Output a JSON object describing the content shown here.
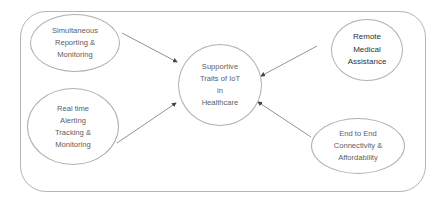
{
  "diagram": {
    "center": {
      "label": "Supportive\nTraits of IoT\nin\nHealthcare"
    },
    "nodes": [
      {
        "id": "simultaneous",
        "label": "Simultaneous\nReporting &\nMonitoring"
      },
      {
        "id": "realtime",
        "label": "Real time\nAlerting\nTracking &\nMonitoring"
      },
      {
        "id": "remote",
        "label": "Remote\nMedical\nAssistance"
      },
      {
        "id": "endtoend",
        "label": "End to End\nConnectivity &\nAffordability"
      }
    ],
    "edges": [
      {
        "from": "simultaneous",
        "to": "center"
      },
      {
        "from": "realtime",
        "to": "center"
      },
      {
        "from": "remote",
        "to": "center"
      },
      {
        "from": "endtoend",
        "to": "center"
      }
    ],
    "colors": {
      "stroke": "#b0b0b0",
      "arrow": "#555555",
      "text": "#606060"
    }
  }
}
